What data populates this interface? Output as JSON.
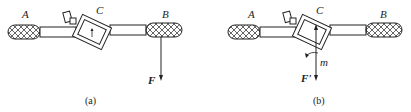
{
  "figures": [
    {
      "id": "a",
      "caption": "(a)",
      "labels": {
        "left_handle": "A",
        "center": "C",
        "right_handle": "B",
        "force": "F"
      }
    },
    {
      "id": "b",
      "caption": "(b)",
      "labels": {
        "left_handle": "A",
        "center": "C",
        "right_handle": "B",
        "force": "F'",
        "moment": "m"
      }
    }
  ],
  "colors": {
    "stroke": "#222222",
    "background": "#ffffff"
  }
}
